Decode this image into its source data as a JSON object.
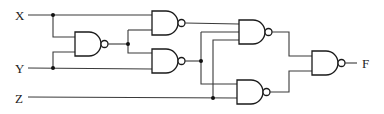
{
  "diagram": {
    "type": "logic-circuit",
    "gate_type": "NAND",
    "inputs": [
      {
        "id": "X",
        "label": "X"
      },
      {
        "id": "Y",
        "label": "Y"
      },
      {
        "id": "Z",
        "label": "Z"
      }
    ],
    "output": {
      "id": "F",
      "label": "F"
    },
    "gates": [
      {
        "id": "G1",
        "type": "NAND",
        "inputs": [
          "X",
          "Y"
        ]
      },
      {
        "id": "G2",
        "type": "NAND",
        "inputs": [
          "X",
          "G1"
        ]
      },
      {
        "id": "G3",
        "type": "NAND",
        "inputs": [
          "G1",
          "Y"
        ]
      },
      {
        "id": "G4",
        "type": "NAND",
        "inputs": [
          "G2",
          "G3",
          "Y"
        ]
      },
      {
        "id": "G5",
        "type": "NAND",
        "inputs": [
          "G3",
          "Z"
        ]
      },
      {
        "id": "G6",
        "type": "NAND",
        "inputs": [
          "G4",
          "G5"
        ]
      }
    ],
    "colors": {
      "line": "#3a3a3a",
      "background": "#ffffff"
    }
  }
}
